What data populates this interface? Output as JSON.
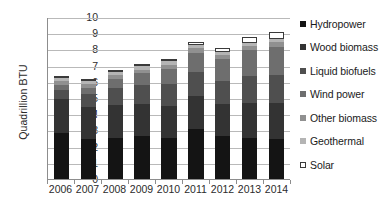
{
  "chart_data": {
    "type": "bar",
    "stacked": true,
    "title": "",
    "xlabel": "",
    "ylabel": "Quadrillion BTU",
    "ylim": [
      0,
      10
    ],
    "ytick_step": 1,
    "yticks": [
      "10",
      "9",
      "8",
      "7",
      "6",
      "5",
      "4",
      "3",
      "2",
      "1",
      "0"
    ],
    "grid": true,
    "legend_position": "right",
    "categories": [
      "2006",
      "2007",
      "2008",
      "2009",
      "2010",
      "2011",
      "2012",
      "2013",
      "2014"
    ],
    "totals": [
      6.2,
      6.0,
      6.5,
      6.9,
      7.2,
      8.2,
      7.8,
      8.3,
      8.7
    ],
    "series": [
      {
        "name": "Hydropower",
        "color": "#141414",
        "values": [
          2.87,
          2.45,
          2.51,
          2.67,
          2.53,
          3.1,
          2.63,
          2.56,
          2.47
        ]
      },
      {
        "name": "Wood biomass",
        "color": "#333333",
        "values": [
          2.05,
          2.01,
          2.04,
          1.95,
          2.0,
          2.03,
          1.99,
          2.14,
          2.22
        ]
      },
      {
        "name": "Liquid biofuels",
        "color": "#4f4f4f",
        "values": [
          0.6,
          0.8,
          1.05,
          1.18,
          1.35,
          1.5,
          1.45,
          1.65,
          1.75
        ]
      },
      {
        "name": "Wind power",
        "color": "#6e6e6e",
        "values": [
          0.26,
          0.34,
          0.55,
          0.72,
          0.92,
          1.17,
          1.34,
          1.6,
          1.73
        ]
      },
      {
        "name": "Other biomass",
        "color": "#909090",
        "values": [
          0.25,
          0.25,
          0.25,
          0.24,
          0.26,
          0.26,
          0.25,
          0.25,
          0.26
        ]
      },
      {
        "name": "Geothermal",
        "color": "#b4b4b4",
        "values": [
          0.18,
          0.18,
          0.19,
          0.2,
          0.21,
          0.21,
          0.21,
          0.22,
          0.22
        ]
      },
      {
        "name": "Solar",
        "color": "#ffffff",
        "values": [
          0.07,
          0.08,
          0.09,
          0.1,
          0.13,
          0.16,
          0.24,
          0.32,
          0.43
        ]
      }
    ]
  },
  "legend": {
    "items": [
      {
        "label": "Hydropower"
      },
      {
        "label": "Wood biomass"
      },
      {
        "label": "Liquid biofuels"
      },
      {
        "label": "Wind power"
      },
      {
        "label": "Other biomass"
      },
      {
        "label": "Geothermal"
      },
      {
        "label": "Solar"
      }
    ]
  }
}
